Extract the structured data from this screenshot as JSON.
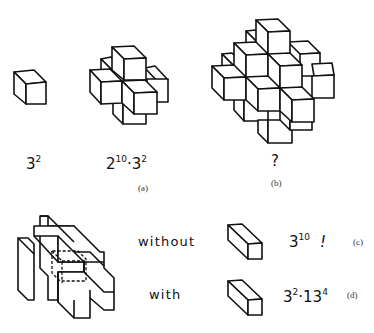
{
  "figure": {
    "row1": {
      "items": [
        {
          "id": "single-cube",
          "label_base": "3",
          "label_exp": "2"
        },
        {
          "id": "seven-cube-cluster",
          "label_parts": [
            {
              "base": "2",
              "exp": "10"
            },
            {
              "sep": "·"
            },
            {
              "base": "3",
              "exp": "2"
            }
          ]
        },
        {
          "id": "large-cluster",
          "label": "?"
        }
      ],
      "captions": {
        "a": "(a)",
        "b": "(b)"
      }
    },
    "row2": {
      "without_label": "without",
      "with_label": "with",
      "without_result": {
        "base": "3",
        "exp": "10",
        "suffix": "!"
      },
      "with_result": {
        "base1": "3",
        "exp1": "2",
        "sep": "·",
        "base2": "13",
        "exp2": "4"
      },
      "captions": {
        "c": "(c)",
        "d": "(d)"
      }
    }
  },
  "colors": {
    "ink": "#111111",
    "paper": "#ffffff",
    "caption": "#333333"
  }
}
